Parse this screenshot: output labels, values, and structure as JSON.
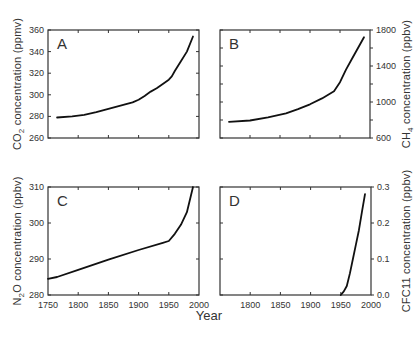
{
  "figure": {
    "xlabel": "Year",
    "x_ticks": [
      1750,
      1800,
      1850,
      1900,
      1950,
      2000
    ],
    "x_range": [
      1750,
      2000
    ]
  },
  "chart_data": [
    {
      "type": "line",
      "panel": "A",
      "title": "",
      "xlabel": "Year",
      "ylabel": "CO2 concentration (ppmv)",
      "ylabel_parts": {
        "pre": "CO",
        "sub": "2",
        "post": " concentration (ppmv)"
      },
      "ylabel_side": "left",
      "ylim": [
        260,
        360
      ],
      "y_ticks": [
        260,
        280,
        300,
        320,
        340,
        360
      ],
      "xlim": [
        1750,
        2000
      ],
      "x_ticks": [
        1750,
        1800,
        1850,
        1900,
        1950,
        2000
      ],
      "x_tick_labels_shown": false,
      "grid": false,
      "series": [
        {
          "name": "CO2",
          "x": [
            1765,
            1790,
            1810,
            1830,
            1850,
            1870,
            1890,
            1900,
            1910,
            1920,
            1930,
            1940,
            1950,
            1955,
            1960,
            1970,
            1980,
            1990
          ],
          "y": [
            279,
            280,
            281.5,
            284,
            287,
            290,
            293,
            295.5,
            299,
            303,
            306,
            310,
            314,
            317,
            322,
            331,
            340,
            354
          ]
        }
      ]
    },
    {
      "type": "line",
      "panel": "B",
      "title": "",
      "xlabel": "Year",
      "ylabel": "CH4 concentration (ppbv)",
      "ylabel_parts": {
        "pre": "CH",
        "sub": "4",
        "post": " concentration (ppbv)"
      },
      "ylabel_side": "right",
      "ylim": [
        600,
        1800
      ],
      "y_ticks": [
        600,
        1000,
        1400,
        1800
      ],
      "y_minor_ticks": [
        800,
        1200,
        1600
      ],
      "xlim": [
        1750,
        2000
      ],
      "x_ticks": [
        1750,
        1800,
        1850,
        1900,
        1950,
        2000
      ],
      "x_tick_labels_shown": false,
      "grid": false,
      "series": [
        {
          "name": "CH4",
          "x": [
            1765,
            1800,
            1830,
            1860,
            1880,
            1900,
            1920,
            1940,
            1950,
            1960,
            1970,
            1980,
            1990
          ],
          "y": [
            780,
            795,
            830,
            875,
            920,
            975,
            1040,
            1120,
            1220,
            1360,
            1480,
            1600,
            1720
          ]
        }
      ]
    },
    {
      "type": "line",
      "panel": "C",
      "title": "",
      "xlabel": "Year",
      "ylabel": "N2O concentration (ppbv)",
      "ylabel_parts": {
        "pre": "N",
        "sub": "2",
        "post": "O concentration (ppbv)"
      },
      "ylabel_side": "left",
      "ylim": [
        280,
        310
      ],
      "y_ticks": [
        280,
        290,
        300,
        310
      ],
      "xlim": [
        1750,
        2000
      ],
      "x_ticks": [
        1750,
        1800,
        1850,
        1900,
        1950,
        2000
      ],
      "x_tick_labels_shown": true,
      "grid": false,
      "series": [
        {
          "name": "N2O",
          "x": [
            1750,
            1765,
            1800,
            1850,
            1900,
            1940,
            1950,
            1960,
            1970,
            1980,
            1990
          ],
          "y": [
            284.5,
            285,
            287,
            289.8,
            292.5,
            294.5,
            295,
            297,
            299.5,
            303,
            310
          ]
        }
      ]
    },
    {
      "type": "line",
      "panel": "D",
      "title": "",
      "xlabel": "Year",
      "ylabel": "CFC11 concentration (ppbv)",
      "ylabel_parts": {
        "pre": "CFC11",
        "sub": "",
        "post": " concentration (ppbv)"
      },
      "ylabel_side": "right",
      "ylim": [
        0.0,
        0.3
      ],
      "y_ticks": [
        0.0,
        0.1,
        0.2,
        0.3
      ],
      "y_tick_labels": [
        "0.0",
        "0.1",
        "0.2",
        "0.3"
      ],
      "xlim": [
        1750,
        2000
      ],
      "x_ticks": [
        1750,
        1800,
        1850,
        1900,
        1950,
        2000
      ],
      "x_tick_labels": [
        "1800",
        "1850",
        "1900",
        "1950",
        "2000"
      ],
      "x_tick_labels_shown": true,
      "grid": false,
      "series": [
        {
          "name": "CFC11",
          "x": [
            1950,
            1955,
            1960,
            1965,
            1970,
            1975,
            1980,
            1985,
            1990
          ],
          "y": [
            0.0,
            0.01,
            0.025,
            0.06,
            0.1,
            0.14,
            0.18,
            0.23,
            0.28
          ]
        }
      ]
    }
  ]
}
